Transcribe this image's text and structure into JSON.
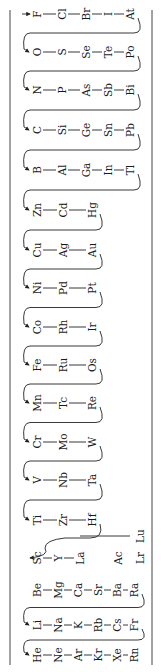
{
  "chains": [
    {
      "id": "halogens",
      "elements": [
        "F",
        "Cl",
        "Br",
        "I",
        "At"
      ],
      "y": 14,
      "entry_arrow": true
    },
    {
      "id": "chalcogens",
      "elements": [
        "O",
        "S",
        "Se",
        "Te",
        "Po"
      ],
      "y": 52
    },
    {
      "id": "pnictogens",
      "elements": [
        "N",
        "P",
        "As",
        "Sb",
        "Bi"
      ],
      "y": 90
    },
    {
      "id": "group14",
      "elements": [
        "C",
        "Si",
        "Ge",
        "Sn",
        "Pb"
      ],
      "y": 130
    },
    {
      "id": "group13",
      "elements": [
        "B",
        "Al",
        "Ga",
        "In",
        "Tl"
      ],
      "y": 170
    },
    {
      "id": "group12",
      "elements": [
        "Zn",
        "Cd",
        "Hg"
      ],
      "y": 210
    },
    {
      "id": "group11",
      "elements": [
        "Cu",
        "Ag",
        "Au"
      ],
      "y": 250
    },
    {
      "id": "group10",
      "elements": [
        "Ni",
        "Pd",
        "Pt"
      ],
      "y": 288
    },
    {
      "id": "group9",
      "elements": [
        "Co",
        "Rh",
        "Ir"
      ],
      "y": 327
    },
    {
      "id": "group8",
      "elements": [
        "Fe",
        "Ru",
        "Os"
      ],
      "y": 365
    },
    {
      "id": "group7",
      "elements": [
        "Mn",
        "Tc",
        "Re"
      ],
      "y": 403
    },
    {
      "id": "group6",
      "elements": [
        "Cr",
        "Mo",
        "W"
      ],
      "y": 442
    },
    {
      "id": "group5",
      "elements": [
        "V",
        "Nb",
        "Ta"
      ],
      "y": 480
    },
    {
      "id": "group4",
      "elements": [
        "Ti",
        "Zr",
        "Hf"
      ],
      "y": 520
    },
    {
      "id": "group3",
      "elements": [
        "Sc",
        "Y",
        "La",
        "Ac"
      ],
      "y": 558
    },
    {
      "id": "alkaline_earth",
      "elements": [
        "Be",
        "Mg",
        "Ca",
        "Sr",
        "Ba",
        "Ra"
      ],
      "y": 590
    },
    {
      "id": "alkali",
      "elements": [
        "Li",
        "Na",
        "K",
        "Rb",
        "Cs",
        "Fr"
      ],
      "y": 625
    },
    {
      "id": "noble_gases",
      "elements": [
        "He",
        "Ne",
        "Ar",
        "Kr",
        "Xe",
        "Rn"
      ],
      "y": 655
    }
  ],
  "f_block": {
    "lanthanides": {
      "from": "La",
      "to": "Lu"
    },
    "actinides": {
      "from": "Ac",
      "to": "Lr"
    }
  },
  "labels": {
    "F": "F",
    "Cl": "Cl",
    "Br": "Br",
    "I": "I",
    "At": "At",
    "O": "O",
    "S": "S",
    "Se": "Se",
    "Te": "Te",
    "Po": "Po",
    "N": "N",
    "P": "P",
    "As": "As",
    "Sb": "Sb",
    "Bi": "Bi",
    "C": "C",
    "Si": "Si",
    "Ge": "Ge",
    "Sn": "Sn",
    "Pb": "Pb",
    "B": "B",
    "Al": "Al",
    "Ga": "Ga",
    "In": "In",
    "Tl": "Tl",
    "Zn": "Zn",
    "Cd": "Cd",
    "Hg": "Hg",
    "Cu": "Cu",
    "Ag": "Ag",
    "Au": "Au",
    "Ni": "Ni",
    "Pd": "Pd",
    "Pt": "Pt",
    "Co": "Co",
    "Rh": "Rh",
    "Ir": "Ir",
    "Fe": "Fe",
    "Ru": "Ru",
    "Os": "Os",
    "Mn": "Mn",
    "Tc": "Tc",
    "Re": "Re",
    "Cr": "Cr",
    "Mo": "Mo",
    "W": "W",
    "V": "V",
    "Nb": "Nb",
    "Ta": "Ta",
    "Ti": "Ti",
    "Zr": "Zr",
    "Hf": "Hf",
    "Sc": "Sc",
    "Y": "Y",
    "La": "La",
    "Ac": "Ac",
    "Lu": "Lu",
    "Lr": "Lr",
    "Be": "Be",
    "Mg": "Mg",
    "Ca": "Ca",
    "Sr": "Sr",
    "Ba": "Ba",
    "Ra": "Ra",
    "Li": "Li",
    "Na": "Na",
    "K": "K",
    "Rb": "Rb",
    "Cs": "Cs",
    "Fr": "Fr",
    "He": "He",
    "Ne": "Ne",
    "Ar": "Ar",
    "Kr": "Kr",
    "Xe": "Xe",
    "Rn": "Rn"
  }
}
